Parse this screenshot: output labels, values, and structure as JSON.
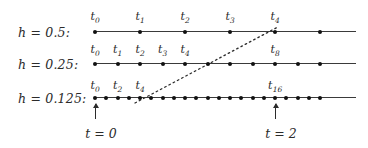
{
  "figure": {
    "background_color": "#ffffff",
    "line_color": "#3a3a3a",
    "dot_color": "#111111",
    "text_color": "#2b2b2b"
  },
  "rows": [
    {
      "id": "row-h-0p5",
      "label": "h = 0.5:",
      "label_x": 18,
      "label_y": 25,
      "axis_y": 31,
      "axis_x_start": 95,
      "axis_x_end": 356,
      "dot_spacing": 45,
      "dot_count": 6,
      "dot_x_start": 95,
      "ticks": [
        {
          "name": "t",
          "sub": "0",
          "x": 95
        },
        {
          "name": "t",
          "sub": "1",
          "x": 140
        },
        {
          "name": "t",
          "sub": "2",
          "x": 185
        },
        {
          "name": "t",
          "sub": "3",
          "x": 230
        },
        {
          "name": "t",
          "sub": "4",
          "x": 275
        }
      ],
      "tick_label_y": 10
    },
    {
      "id": "row-h-0p25",
      "label": "h = 0.25:",
      "label_x": 18,
      "label_y": 57,
      "axis_y": 63,
      "axis_x_start": 95,
      "axis_x_end": 356,
      "dot_spacing": 22.5,
      "dot_count": 11,
      "dot_x_start": 95,
      "ticks": [
        {
          "name": "t",
          "sub": "0",
          "x": 95
        },
        {
          "name": "t",
          "sub": "1",
          "x": 117.5
        },
        {
          "name": "t",
          "sub": "2",
          "x": 140
        },
        {
          "name": "t",
          "sub": "3",
          "x": 162.5
        },
        {
          "name": "t",
          "sub": "4",
          "x": 185
        },
        {
          "name": "t",
          "sub": "8",
          "x": 275
        }
      ],
      "tick_label_y": 43
    },
    {
      "id": "row-h-0p125",
      "label": "h = 0.125:",
      "label_x": 18,
      "label_y": 91,
      "axis_y": 97,
      "axis_x_start": 95,
      "axis_x_end": 356,
      "dot_spacing": 11.25,
      "dot_count": 21,
      "dot_x_start": 95,
      "ticks": [
        {
          "name": "t",
          "sub": "0",
          "x": 95
        },
        {
          "name": "t",
          "sub": "2",
          "x": 117.5
        },
        {
          "name": "t",
          "sub": "4",
          "x": 140
        },
        {
          "name": "t",
          "sub": "16",
          "x": 275
        }
      ],
      "tick_label_y": 79
    }
  ],
  "connector": {
    "style": "dotted",
    "color": "#2b2b2b",
    "dash": "1.6 3.2",
    "width": 1.3,
    "x1": 135,
    "y1": 103,
    "x2": 278,
    "y2": 27
  },
  "markers": [
    {
      "id": "marker-t0",
      "label": "t = 0",
      "x": 95,
      "shaft_top": 104,
      "shaft_height": 15,
      "head_y": 103,
      "label_y": 126
    },
    {
      "id": "marker-t2",
      "label": "t = 2",
      "x": 275,
      "shaft_top": 104,
      "shaft_height": 15,
      "head_y": 103,
      "label_y": 126
    }
  ]
}
